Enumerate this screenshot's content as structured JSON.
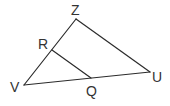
{
  "diagram": {
    "type": "triangle-with-segment",
    "points": {
      "Z": {
        "label": "Z",
        "x": 76,
        "y": 19,
        "lx": 71,
        "ly": 15
      },
      "V": {
        "label": "V",
        "x": 24,
        "y": 85,
        "lx": 10,
        "ly": 92
      },
      "U": {
        "label": "U",
        "x": 150,
        "y": 72,
        "lx": 152,
        "ly": 82
      },
      "R": {
        "label": "R",
        "x": 52,
        "y": 50,
        "lx": 38,
        "ly": 49
      },
      "Q": {
        "label": "Q",
        "x": 91,
        "y": 78,
        "lx": 86,
        "ly": 96
      }
    },
    "segments": [
      {
        "from": "Z",
        "to": "V"
      },
      {
        "from": "Z",
        "to": "U"
      },
      {
        "from": "V",
        "to": "U"
      },
      {
        "from": "R",
        "to": "Q"
      }
    ],
    "colors": {
      "line": "#2b2b2b",
      "label": "#333333",
      "background": "#ffffff"
    }
  }
}
